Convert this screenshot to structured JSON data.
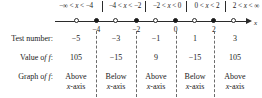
{
  "figure": {
    "type": "sign-chart",
    "axis_name": "x",
    "intervals": [
      {
        "label": "−∞ < x < −4",
        "center_pct": 11.5
      },
      {
        "label": "−4 < x < −2",
        "center_pct": 31.5
      },
      {
        "label": "−2 < x < 0",
        "center_pct": 51.5
      },
      {
        "label": "0 < x < 2",
        "center_pct": 70.5
      },
      {
        "label": "2 < x < ∞",
        "center_pct": 89.5
      }
    ],
    "boundaries": [
      {
        "value": "−4",
        "pos_pct": 21.0
      },
      {
        "value": "−2",
        "pos_pct": 41.5
      },
      {
        "value": "0",
        "pos_pct": 61.5
      },
      {
        "value": "2",
        "pos_pct": 81.0
      }
    ],
    "test_points": [
      {
        "value": "−5",
        "pos_pct": 11.0
      },
      {
        "value": "−3",
        "pos_pct": 31.0
      },
      {
        "value": "−1",
        "pos_pct": 51.5
      },
      {
        "value": "1",
        "pos_pct": 71.0
      },
      {
        "value": "3",
        "pos_pct": 91.0
      }
    ]
  },
  "table": {
    "row_labels": {
      "test_number": "Test number:",
      "value_of_f": "Value of f:",
      "graph_of_f": "Graph of f:"
    },
    "columns": [
      {
        "test_number": "−5",
        "value_of_f": "105",
        "graph_of_f_line1": "Above",
        "graph_of_f_line2": "x-axis"
      },
      {
        "test_number": "−3",
        "value_of_f": "−15",
        "graph_of_f_line1": "Below",
        "graph_of_f_line2": "x-axis"
      },
      {
        "test_number": "−1",
        "value_of_f": "9",
        "graph_of_f_line1": "Above",
        "graph_of_f_line2": "x-axis"
      },
      {
        "test_number": "1",
        "value_of_f": "−15",
        "graph_of_f_line1": "Below",
        "graph_of_f_line2": "x-axis"
      },
      {
        "test_number": "3",
        "value_of_f": "105",
        "graph_of_f_line1": "Above",
        "graph_of_f_line2": "x-axis"
      }
    ]
  },
  "chart_data": {
    "type": "table",
    "title": "",
    "xlabel": "x",
    "ylabel": "",
    "categories": [
      "−∞ < x < −4",
      "−4 < x < −2",
      "−2 < x < 0",
      "0 < x < 2",
      "2 < x < ∞"
    ],
    "series": [
      {
        "name": "Test number",
        "values": [
          -5,
          -3,
          -1,
          1,
          3
        ]
      },
      {
        "name": "Value of f",
        "values": [
          105,
          -15,
          9,
          -15,
          105
        ]
      },
      {
        "name": "Graph of f",
        "values": [
          "Above x-axis",
          "Below x-axis",
          "Above x-axis",
          "Below x-axis",
          "Above x-axis"
        ]
      }
    ],
    "boundaries": [
      -4,
      -2,
      0,
      2
    ],
    "grid": false,
    "legend": "none"
  }
}
